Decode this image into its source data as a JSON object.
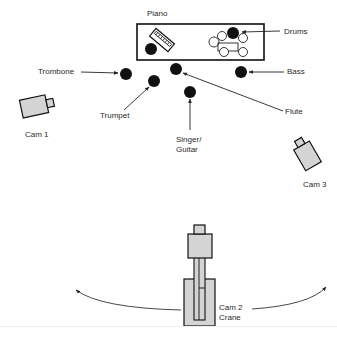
{
  "colors": {
    "ink": "#111111",
    "line": "#333333",
    "camera_fill": "#d4d4d4",
    "background": "#ffffff"
  },
  "labels": {
    "piano": "Piano",
    "drums": "Drums",
    "bass": "Bass",
    "trombone": "Trombone",
    "trumpet": "Trumpet",
    "flute": "Flute",
    "singer_line1": "Singer/",
    "singer_line2": "Guitar",
    "cam1": "Cam 1",
    "cam3": "Cam 3",
    "cam2_line1": "Cam 2",
    "cam2_line2": "Crane"
  },
  "instruments": [
    {
      "name": "piano-player",
      "x": 151,
      "y": 49,
      "r": 6
    },
    {
      "name": "drummer",
      "x": 233,
      "y": 33,
      "r": 6
    },
    {
      "name": "trombone",
      "x": 126,
      "y": 74,
      "r": 6
    },
    {
      "name": "trumpet",
      "x": 154,
      "y": 81,
      "r": 6
    },
    {
      "name": "flute",
      "x": 176,
      "y": 69,
      "r": 6
    },
    {
      "name": "bass",
      "x": 241,
      "y": 72,
      "r": 6
    },
    {
      "name": "singer-guitar",
      "x": 190,
      "y": 92,
      "r": 6
    }
  ],
  "cameras": [
    {
      "name": "cam-1",
      "label_key": "cam1"
    },
    {
      "name": "cam-2-crane",
      "label_key": "cam2_line1"
    },
    {
      "name": "cam-3",
      "label_key": "cam3"
    }
  ]
}
